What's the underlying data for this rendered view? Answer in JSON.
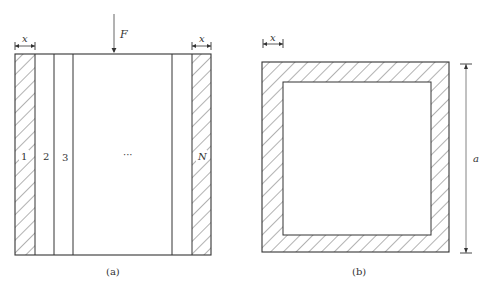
{
  "figure_a": {
    "caption": "(a)",
    "force_label": "F",
    "dim_label": "x",
    "strip_labels": [
      "1",
      "2",
      "3",
      "···",
      "N"
    ]
  },
  "figure_b": {
    "caption": "(b)",
    "dim_label_x": "x",
    "dim_label_a": "a"
  },
  "colors": {
    "line": "#333333",
    "hatch": "#555555",
    "background": "#ffffff"
  }
}
